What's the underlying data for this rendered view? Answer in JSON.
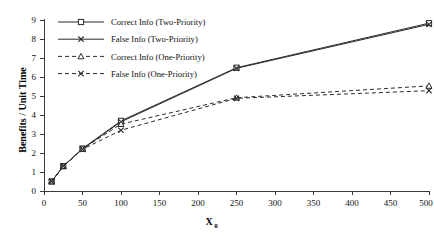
{
  "chart_data": {
    "type": "line",
    "title": "",
    "xlabel": "X0",
    "xlabel_base": "X",
    "xlabel_sub": "0",
    "ylabel": "Benefits / Unit Time",
    "xlim": [
      0,
      500
    ],
    "ylim": [
      0,
      9
    ],
    "xticks": [
      0,
      50,
      100,
      150,
      200,
      250,
      300,
      350,
      400,
      450,
      500
    ],
    "yticks": [
      0,
      1,
      2,
      3,
      4,
      5,
      6,
      7,
      8,
      9
    ],
    "grid": false,
    "legend_position": "top-left-inside",
    "series": [
      {
        "name": "Correct Info (Two-Priority)",
        "marker": "square-open",
        "line_style": "solid",
        "color": "#2b2b2b",
        "x": [
          10,
          25,
          50,
          100,
          250,
          500
        ],
        "values": [
          0.5,
          1.3,
          2.22,
          3.67,
          6.45,
          8.78
        ]
      },
      {
        "name": "False Info (Two-Priority)",
        "marker": "x",
        "line_style": "solid",
        "color": "#2b2b2b",
        "x": [
          10,
          25,
          50,
          100,
          250,
          500
        ],
        "values": [
          0.5,
          1.3,
          2.2,
          3.62,
          6.42,
          8.72
        ]
      },
      {
        "name": "Correct Info (One-Priority)",
        "marker": "triangle-open",
        "line_style": "dashed",
        "color": "#2b2b2b",
        "x": [
          10,
          25,
          50,
          100,
          250,
          500
        ],
        "values": [
          0.5,
          1.3,
          2.2,
          3.5,
          4.88,
          5.5
        ]
      },
      {
        "name": "False Info (One-Priority)",
        "marker": "x",
        "line_style": "dashed",
        "color": "#2b2b2b",
        "x": [
          10,
          25,
          50,
          100,
          250,
          500
        ],
        "values": [
          0.5,
          1.3,
          2.18,
          3.18,
          4.85,
          5.25
        ]
      }
    ],
    "legend": [
      "Correct Info (Two-Priority)",
      "False Info (Two-Priority)",
      "Correct Info (One-Priority)",
      "False Info (One-Priority)"
    ]
  }
}
